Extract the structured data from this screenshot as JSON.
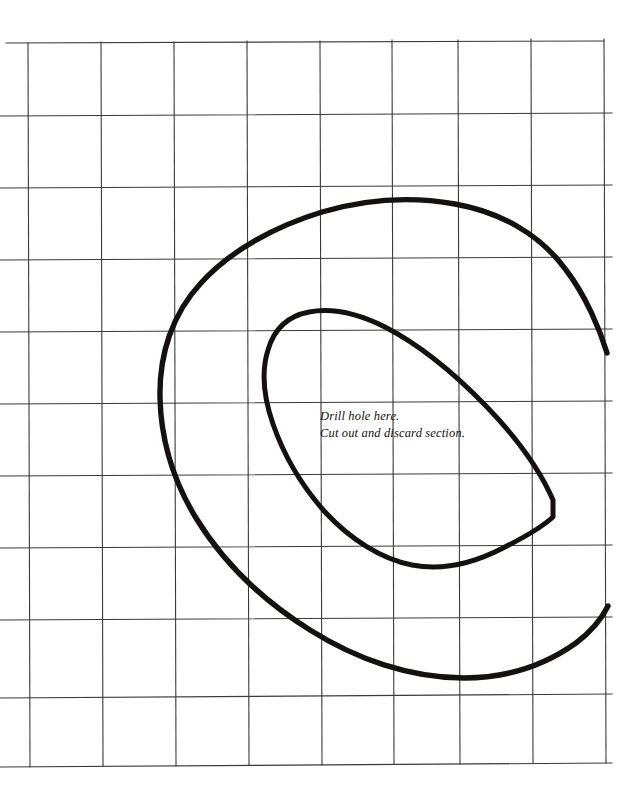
{
  "document": {
    "kind": "woodworking-pattern-template",
    "background_color": "#ffffff",
    "ink_color": "#141110",
    "grid_color": "#3a3a3a",
    "width": 633,
    "height": 800
  },
  "grid": {
    "label": "squared enlargement grid",
    "columns": 8,
    "rows": 10,
    "cell_width": 73,
    "cell_height": 72,
    "left": 28,
    "top": 43,
    "right": 604,
    "bottom": 765,
    "vertical_lines_x": [
      28,
      101,
      174,
      247,
      320,
      385,
      458,
      531,
      604
    ],
    "horizontal_lines_y": [
      43,
      115,
      187,
      259,
      331,
      403,
      475,
      547,
      619,
      691,
      765
    ],
    "stroke_width": 1.1
  },
  "shapes": {
    "outer_curve": {
      "name": "outer-spiral-cutline",
      "stroke_width": 5.4,
      "path": "M 607 353 C 600 330 586 296 566 270 C 540 234 500 212 455 204 C 410 196 363 200 322 212 C 276 226 231 250 201 283 C 172 314 159 355 160 398 C 161 440 174 482 196 518 C 223 562 262 600 310 630 C 356 659 410 678 464 678 C 506 678 545 665 576 643 C 592 631 602 618 608 606"
    },
    "inner_curve": {
      "name": "inner-teardrop-discard-outline",
      "stroke_width": 5.0,
      "path": "M 553 517 L 553 500 C 540 470 516 437 486 406 C 455 374 418 344 385 327 C 357 313 330 308 309 312 C 288 316 274 329 268 350 C 261 372 264 398 273 424 C 283 453 301 485 325 512 C 350 539 381 559 412 565 C 443 571 474 563 503 548 C 525 537 542 527 553 517 Z"
    }
  },
  "annotations": {
    "note": {
      "name": "drill-and-discard-note",
      "lines": [
        "Drill hole here.",
        "Cut out and discard section."
      ]
    }
  }
}
